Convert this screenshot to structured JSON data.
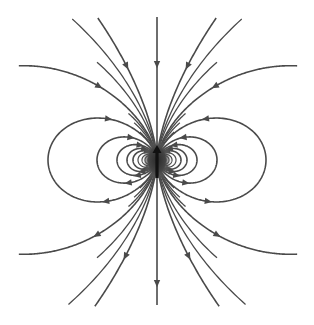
{
  "diagram": {
    "title": "",
    "width": 314,
    "height": 325,
    "center": {
      "x": 157,
      "y": 160
    },
    "colors": {
      "background": "#ffffff",
      "line": "#4a4a4a",
      "core": "#3c3c3c",
      "magnet_arrow": "#111111"
    },
    "flow_direction": "lines enter the dipole from the top and exit at the bottom; closed loops leave below and return above",
    "closed_loops_L": [
      109,
      60,
      40,
      30,
      24,
      19,
      15,
      12,
      9
    ],
    "loop_arrow_L_min": 24,
    "open_lines_L": [
      245,
      1040
    ],
    "vertical_line": {
      "y_top": 17,
      "y_bottom": 305,
      "arrows_y": [
        63,
        282
      ]
    },
    "clip": {
      "x_min": 18,
      "x_max": 298,
      "y_min": 17,
      "y_max": 307
    },
    "magnet_arrow": {
      "x": 157,
      "y_tail": 178,
      "y_head": 145,
      "direction": "up"
    },
    "labels": []
  }
}
